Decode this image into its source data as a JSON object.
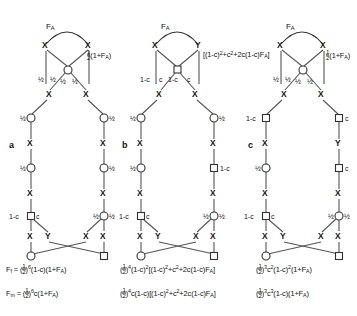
{
  "figure": {
    "panels": [
      {
        "id": "a",
        "letter": "a",
        "top_arc_label": "F_A",
        "right_label_parts": [
          "1/2",
          "(1+F",
          "A",
          ")"
        ],
        "right_label_text": "½(1+F_A)",
        "node_labels_upper": [
          "½",
          "½",
          "½",
          "½"
        ],
        "mid_left_label": "½",
        "mid_right_label": "½",
        "left_chain_label": "½",
        "right_chain_label": "½",
        "lower_left_labels": [
          "1-c",
          "c"
        ],
        "lower_right_labels": [
          "½",
          "½"
        ],
        "cross_letters": [
          "X",
          "Y",
          "X",
          "X"
        ],
        "formulas": [
          {
            "lhs": "F_f",
            "rhs": "(½)^6 (1-c)(1+F_A)"
          },
          {
            "lhs": "F_m",
            "rhs": "(½)^6 c(1+F_A)"
          }
        ]
      },
      {
        "id": "b",
        "letter": "b",
        "top_arc_label": "F_A",
        "top_nodes": [
          "X",
          "Y"
        ],
        "bracket_label": "[(1-c)^2 + c^2 + 2c(1-c)F_A]",
        "square_edge_labels": [
          "1-c",
          "c",
          "1-c",
          "c"
        ],
        "mid_left_label": "½",
        "mid_right_label": "½",
        "left_chain_label": "½",
        "right_chain_label": "1-c",
        "lower_left_labels": [
          "1-c",
          "c"
        ],
        "lower_right_labels": [
          "½",
          "½"
        ],
        "cross_letters": [
          "X",
          "Y",
          "X",
          "X"
        ],
        "formulas": [
          {
            "lhs": "",
            "rhs": "(½)^4 (1-c)^2 [(1-c)^2 + c^2 + 2c(1-c)F_A]"
          },
          {
            "lhs": "",
            "rhs": "(½)^4 c(1-c)[(1-c)^2 + c^2 + 2c(1-c)F_A]"
          }
        ]
      },
      {
        "id": "c",
        "letter": "c",
        "top_arc_label": "F_A",
        "right_label_text": "½(1+F_A)",
        "node_labels_upper": [
          "½",
          "½",
          "½",
          "½"
        ],
        "left_chain_labels": [
          "1-c",
          "½"
        ],
        "right_chain_labels": [
          "c",
          "c"
        ],
        "lower_left_labels": [
          "1-c",
          "c"
        ],
        "lower_right_labels": [
          "½",
          "½"
        ],
        "cross_letters": [
          "X",
          "Y",
          "X",
          "X"
        ],
        "formulas": [
          {
            "lhs": "",
            "rhs": "(½)^3 c^2(1-c)^2(1+F_A)"
          },
          {
            "lhs": "",
            "rhs": "(½)^3 c^3(1-c)(1+F_A)"
          }
        ]
      }
    ],
    "symbols": {
      "half": "½",
      "one_minus_c": "1-c",
      "c": "c",
      "F_A": "F_A",
      "F_f": "F_f",
      "F_m": "F_m",
      "X": "X",
      "Y": "Y"
    },
    "colors": {
      "stroke": "#333333",
      "edge": "#555555",
      "text": "#111111",
      "background": "#ffffff"
    }
  }
}
